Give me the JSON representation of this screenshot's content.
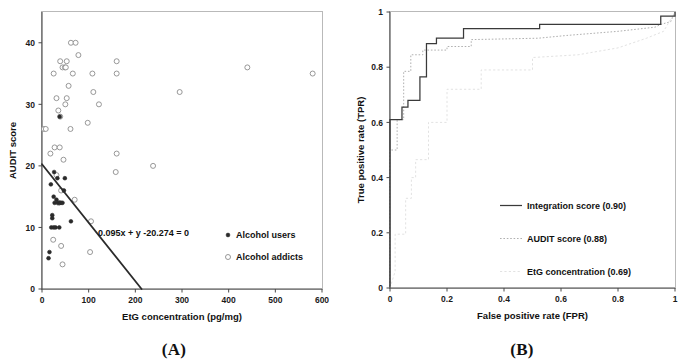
{
  "figure": {
    "panel_a_caption": "(A)",
    "panel_b_caption": "(B)"
  },
  "chart_data": [
    {
      "type": "scatter",
      "panel": "A",
      "title": "",
      "xlabel": "EtG concentration (pg/mg)",
      "ylabel": "AUDIT score",
      "xlim": [
        0,
        600
      ],
      "ylim": [
        0,
        45
      ],
      "xticks": [
        0,
        100,
        200,
        300,
        400,
        500,
        600
      ],
      "xtick_labels": [
        "0",
        "100",
        "200",
        "300",
        "400",
        "500",
        "600"
      ],
      "yticks": [
        0,
        10,
        20,
        30,
        40
      ],
      "ytick_labels": [
        "0",
        "10",
        "20",
        "30",
        "40"
      ],
      "grid": false,
      "annotation": "0.095x + y -20.274 = 0",
      "annotation_x": 120,
      "annotation_y": 8.6,
      "decision_line": {
        "slope": -0.095,
        "intercept": 20.274,
        "x_start": 0,
        "y_start": 20.274,
        "x_end": 213.4,
        "y_end": 0
      },
      "legend_position": "lower right",
      "series": [
        {
          "name": "Alcohol users",
          "marker": "filled-circle",
          "color": "#2a2a2a",
          "points": [
            [
              38,
              28
            ],
            [
              26,
              19
            ],
            [
              33,
              18
            ],
            [
              49,
              18
            ],
            [
              19,
              17
            ],
            [
              47,
              16
            ],
            [
              25,
              15
            ],
            [
              31,
              14.5
            ],
            [
              34,
              14
            ],
            [
              38,
              14
            ],
            [
              41,
              14
            ],
            [
              22,
              12
            ],
            [
              22,
              11.5
            ],
            [
              62,
              11
            ],
            [
              20,
              10
            ],
            [
              25,
              10
            ],
            [
              29,
              10
            ],
            [
              37,
              10
            ],
            [
              16,
              6
            ],
            [
              14,
              5
            ],
            [
              44,
              14
            ],
            [
              27,
              14
            ]
          ]
        },
        {
          "name": "Alcohol addicts",
          "marker": "open-circle",
          "color": "#8c8c8c",
          "points": [
            [
              62,
              40
            ],
            [
              72,
              40
            ],
            [
              78,
              38
            ],
            [
              39,
              37
            ],
            [
              53,
              37
            ],
            [
              160,
              37
            ],
            [
              44,
              36
            ],
            [
              49,
              36
            ],
            [
              51,
              36
            ],
            [
              440,
              36
            ],
            [
              25,
              35
            ],
            [
              66,
              35
            ],
            [
              108,
              35
            ],
            [
              160,
              35
            ],
            [
              580,
              35
            ],
            [
              57,
              33
            ],
            [
              110,
              32
            ],
            [
              295,
              32
            ],
            [
              31,
              31
            ],
            [
              53,
              31
            ],
            [
              122,
              30
            ],
            [
              50,
              30
            ],
            [
              35,
              29
            ],
            [
              39,
              28
            ],
            [
              98,
              27
            ],
            [
              61,
              26
            ],
            [
              4,
              26
            ],
            [
              8,
              26
            ],
            [
              27,
              23
            ],
            [
              38,
              23
            ],
            [
              18,
              22
            ],
            [
              160,
              22
            ],
            [
              238,
              20
            ],
            [
              46,
              21
            ],
            [
              158,
              19
            ],
            [
              31,
              18.5
            ],
            [
              41,
              16
            ],
            [
              70,
              14.5
            ],
            [
              36,
              14
            ],
            [
              105,
              11
            ],
            [
              24,
              8
            ],
            [
              41,
              7
            ],
            [
              103,
              6
            ],
            [
              44,
              4
            ]
          ]
        }
      ]
    },
    {
      "type": "line",
      "panel": "B",
      "title": "",
      "xlabel": "False positive rate (FPR)",
      "ylabel": "True positive rate (TPR)",
      "xlim": [
        0,
        1
      ],
      "ylim": [
        0,
        1
      ],
      "xticks": [
        0,
        0.2,
        0.4,
        0.6,
        0.8,
        1
      ],
      "xtick_labels": [
        "0",
        "0.2",
        "0.4",
        "0.6",
        "0.8",
        "1"
      ],
      "yticks": [
        0,
        0.2,
        0.4,
        0.6,
        0.8,
        1
      ],
      "ytick_labels": [
        "0",
        "0.2",
        "0.4",
        "0.6",
        "0.8",
        "1"
      ],
      "grid": false,
      "legend_position": "lower right",
      "series": [
        {
          "name": "Integration score (0.90)",
          "auc": 0.9,
          "style": "solid",
          "color": "#3a3a3a",
          "points": [
            [
              0,
              0
            ],
            [
              0,
              0.61
            ],
            [
              0.042,
              0.61
            ],
            [
              0.042,
              0.655
            ],
            [
              0.063,
              0.655
            ],
            [
              0.063,
              0.68
            ],
            [
              0.105,
              0.68
            ],
            [
              0.105,
              0.765
            ],
            [
              0.128,
              0.765
            ],
            [
              0.128,
              0.885
            ],
            [
              0.163,
              0.885
            ],
            [
              0.163,
              0.905
            ],
            [
              0.258,
              0.905
            ],
            [
              0.258,
              0.94
            ],
            [
              0.525,
              0.94
            ],
            [
              0.525,
              0.955
            ],
            [
              0.95,
              0.955
            ],
            [
              0.95,
              0.985
            ],
            [
              1,
              0.985
            ],
            [
              1,
              1
            ]
          ]
        },
        {
          "name": "AUDIT score (0.88)",
          "auc": 0.88,
          "style": "dotted",
          "color": "#b0b0b0",
          "points": [
            [
              0,
              0
            ],
            [
              0,
              0.5
            ],
            [
              0.025,
              0.5
            ],
            [
              0.025,
              0.61
            ],
            [
              0.048,
              0.61
            ],
            [
              0.048,
              0.785
            ],
            [
              0.073,
              0.785
            ],
            [
              0.073,
              0.845
            ],
            [
              0.115,
              0.845
            ],
            [
              0.115,
              0.862
            ],
            [
              0.2,
              0.862
            ],
            [
              0.2,
              0.875
            ],
            [
              0.285,
              0.875
            ],
            [
              0.285,
              0.9
            ],
            [
              0.52,
              0.905
            ],
            [
              0.62,
              0.915
            ],
            [
              0.8,
              0.93
            ],
            [
              0.93,
              0.945
            ],
            [
              0.95,
              0.955
            ],
            [
              0.985,
              0.965
            ],
            [
              1,
              1
            ]
          ]
        },
        {
          "name": "EtG concentration (0.69)",
          "auc": 0.69,
          "style": "dashed-faint",
          "color": "#e2e2e2",
          "points": [
            [
              0,
              0
            ],
            [
              0.018,
              0.06
            ],
            [
              0.018,
              0.195
            ],
            [
              0.055,
              0.195
            ],
            [
              0.055,
              0.325
            ],
            [
              0.075,
              0.325
            ],
            [
              0.075,
              0.4
            ],
            [
              0.09,
              0.4
            ],
            [
              0.09,
              0.465
            ],
            [
              0.135,
              0.465
            ],
            [
              0.135,
              0.6
            ],
            [
              0.2,
              0.6
            ],
            [
              0.2,
              0.72
            ],
            [
              0.32,
              0.72
            ],
            [
              0.32,
              0.79
            ],
            [
              0.5,
              0.79
            ],
            [
              0.5,
              0.835
            ],
            [
              0.66,
              0.845
            ],
            [
              0.8,
              0.87
            ],
            [
              0.9,
              0.905
            ],
            [
              0.96,
              0.93
            ],
            [
              1,
              1
            ]
          ]
        }
      ]
    }
  ],
  "panel_a": {
    "y_axis_title": "AUDIT score",
    "x_axis_title": "EtG concentration (pg/mg)",
    "annotation": "0.095x + y -20.274 = 0",
    "legend": [
      {
        "label": "Alcohol users",
        "marker": "filled-circle"
      },
      {
        "label": "Alcohol addicts",
        "marker": "open-circle"
      }
    ]
  },
  "panel_b": {
    "y_axis_title": "True positive rate (TPR)",
    "x_axis_title": "False positive rate (FPR)",
    "legend": [
      {
        "label": "Integration score (0.90)",
        "style": "solid"
      },
      {
        "label": "AUDIT score (0.88)",
        "style": "dotted"
      },
      {
        "label": "EtG concentration (0.69)",
        "style": "dashed-faint"
      }
    ]
  }
}
